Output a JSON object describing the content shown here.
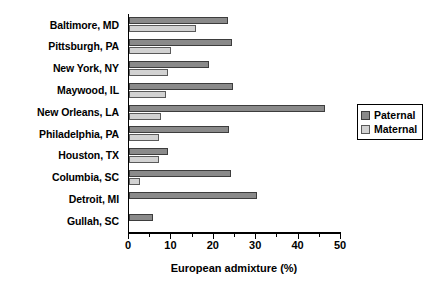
{
  "chart_data": {
    "type": "bar",
    "orientation": "horizontal",
    "title": "",
    "xlabel": "European admixture (%)",
    "ylabel": "",
    "xlim": [
      0,
      50
    ],
    "xticks": [
      0,
      10,
      20,
      30,
      40,
      50
    ],
    "xticklabels": [
      "0",
      "10",
      "20",
      "30",
      "40",
      "50"
    ],
    "minor_tick_interval": 5,
    "grid": false,
    "legend_position": "right",
    "categories": [
      "Baltimore, MD",
      "Pittsburgh, PA",
      "New York, NY",
      "Maywood, IL",
      "New Orleans, LA",
      "Philadelphia, PA",
      "Houston, TX",
      "Columbia, SC",
      "Detroit, MI",
      "Gullah, SC"
    ],
    "series": [
      {
        "name": "Paternal",
        "color": "#8a8a8a",
        "values": [
          23.3,
          24.3,
          18.9,
          24.6,
          46.2,
          23.6,
          9.2,
          24.1,
          30.2,
          5.7
        ]
      },
      {
        "name": "Maternal",
        "color": "#d2d2d2",
        "values": [
          15.8,
          10.0,
          9.2,
          8.7,
          7.5,
          7.1,
          7.1,
          2.5,
          null,
          null
        ]
      }
    ]
  },
  "legend": {
    "items": [
      {
        "label": "Paternal",
        "swatch": "paternal"
      },
      {
        "label": "Maternal",
        "swatch": "maternal"
      }
    ]
  },
  "colors": {
    "paternal": "#8a8a8a",
    "maternal": "#d2d2d2",
    "axis": "#000000",
    "background": "#ffffff"
  }
}
